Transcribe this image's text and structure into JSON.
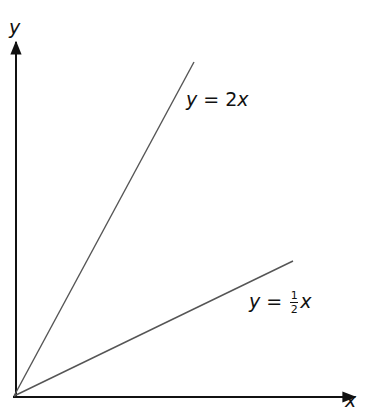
{
  "diagram": {
    "axes": {
      "x_label": "x",
      "y_label": "y",
      "origin": [
        13,
        397
      ],
      "x_end": [
        355,
        397
      ],
      "y_end": [
        16,
        40
      ]
    },
    "lines": [
      {
        "name": "steep",
        "label_prefix": "y = ",
        "label_coef": "2",
        "label_var": "x",
        "from": [
          13,
          397
        ],
        "to": [
          194,
          62
        ],
        "color": "#555555"
      },
      {
        "name": "shallow",
        "label_prefix": "y = ",
        "frac_num": "1",
        "frac_den": "2",
        "label_var": "x",
        "from": [
          13,
          397
        ],
        "to": [
          293,
          261
        ],
        "color": "#555555"
      }
    ],
    "colors": {
      "axis": "#111111",
      "line": "#555555",
      "background": "#ffffff"
    }
  }
}
